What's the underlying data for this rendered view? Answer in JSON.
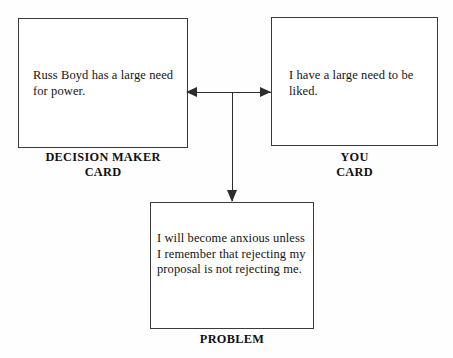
{
  "diagram": {
    "type": "flow-diagram",
    "background_color": "#fefefe",
    "line_color": "#2c2c2c",
    "box_border_color": "#3a3a3a",
    "text_color": "#141414",
    "boxes": [
      {
        "id": "decision-maker",
        "text": "Russ Boyd has a large need for power.",
        "caption": "DECISION MAKER\nCARD"
      },
      {
        "id": "you",
        "text": "I have a large need to be liked.",
        "caption": "YOU\nCARD"
      },
      {
        "id": "problem",
        "text": "I will become anxious unless I remember that rejecting my proposal is not rejecting me.",
        "caption": "PROBLEM"
      }
    ],
    "connectors": [
      {
        "id": "to-decision-maker",
        "direction": "left",
        "from": "junction",
        "to": "decision-maker"
      },
      {
        "id": "to-you",
        "direction": "right",
        "from": "junction",
        "to": "you"
      },
      {
        "id": "to-problem",
        "direction": "down",
        "from": "junction",
        "to": "problem"
      }
    ]
  }
}
